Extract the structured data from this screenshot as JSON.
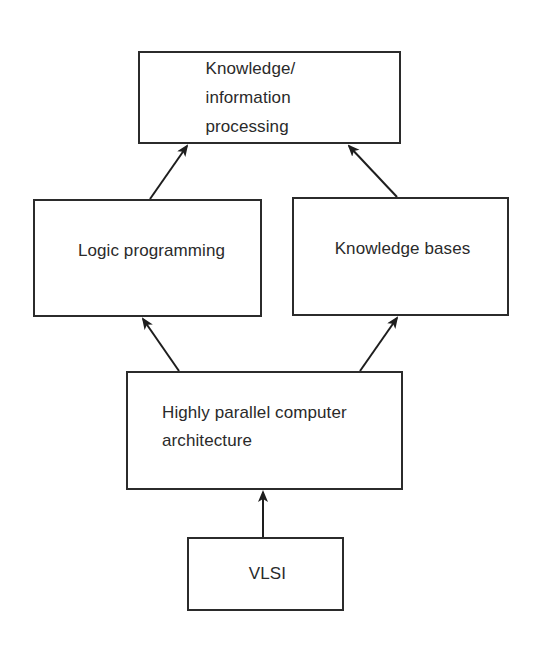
{
  "diagram": {
    "type": "hierarchy-flow",
    "nodes": [
      {
        "id": "knowledge-processing",
        "lines": [
          "Knowledge/",
          "information",
          "processing"
        ]
      },
      {
        "id": "logic-programming",
        "lines": [
          "Logic programming"
        ]
      },
      {
        "id": "knowledge-bases",
        "lines": [
          "Knowledge bases"
        ]
      },
      {
        "id": "parallel-architecture",
        "lines": [
          "Highly parallel computer",
          "architecture"
        ]
      },
      {
        "id": "vlsi",
        "lines": [
          "VLSI"
        ]
      }
    ],
    "edges": [
      {
        "from": "vlsi",
        "to": "parallel-architecture"
      },
      {
        "from": "parallel-architecture",
        "to": "logic-programming"
      },
      {
        "from": "parallel-architecture",
        "to": "knowledge-bases"
      },
      {
        "from": "logic-programming",
        "to": "knowledge-processing"
      },
      {
        "from": "knowledge-bases",
        "to": "knowledge-processing"
      }
    ],
    "colors": {
      "stroke": "#2b2b2b",
      "text": "#2a2a2a",
      "background": "#ffffff"
    }
  }
}
